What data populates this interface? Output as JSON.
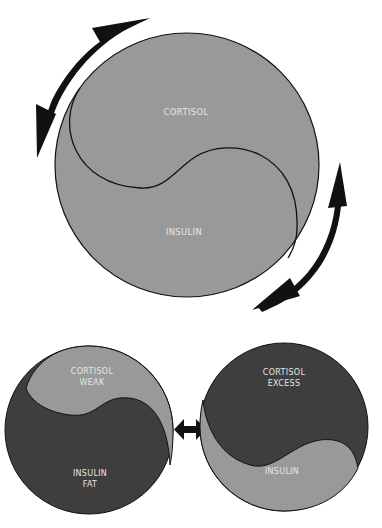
{
  "colors": {
    "light_grey": "#999999",
    "dark_grey": "#3e3e3e",
    "outline": "#111111",
    "arrow": "#111111",
    "label": "#e6e6e6"
  },
  "main_diagram": {
    "top_label": "CORTISOL",
    "bottom_label": "INSULIN",
    "arrows": [
      "rotate-arrow-top-left",
      "rotate-arrow-bottom-right"
    ]
  },
  "left_diagram": {
    "top_label_line1": "CORTISOL",
    "top_label_line2": "WEAK",
    "bottom_label_line1": "INSULIN",
    "bottom_label_line2": "FAT"
  },
  "right_diagram": {
    "top_label_line1": "CORTISOL",
    "top_label_line2": "EXCESS",
    "bottom_label_line1": "INSULIN"
  },
  "connector": "double-headed-arrow"
}
